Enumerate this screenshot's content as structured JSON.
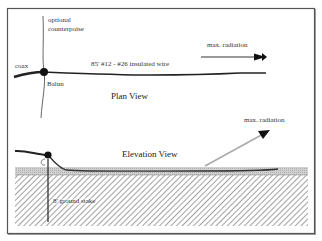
{
  "plan_view": {
    "title": "Plan View",
    "labels": {
      "counterpoise": "optional",
      "counterpoise2": "counterpoise",
      "coax": "coax",
      "wire": "85'  #12 - #26 insulated wire",
      "balun": "Balun",
      "radiation": "max. radiation"
    }
  },
  "elevation_view": {
    "title": "Elevation View",
    "labels": {
      "radiation": "max. radiation",
      "ground_stake": "8' ground stake"
    }
  },
  "colors": {
    "frame": "#555555",
    "wire": "#222222",
    "arrow": "#999999",
    "ground_surface": "#c8c8c8",
    "hatch": "#8a8a8a"
  }
}
